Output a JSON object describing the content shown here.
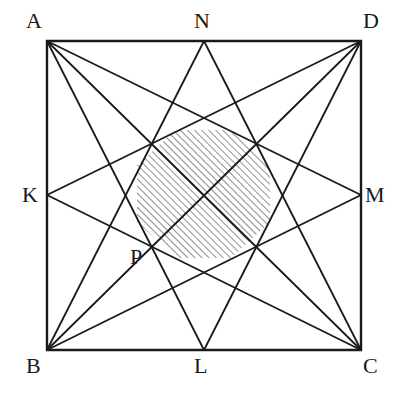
{
  "figure": {
    "background_color": "#ffffff",
    "line_color": "#1a1a1a",
    "hatch_color": "#333333",
    "label_color": "#1a1a1a",
    "canvas": {
      "width": 409,
      "height": 397
    }
  },
  "points": {
    "A": {
      "label": "A",
      "x": 47,
      "y": 41,
      "label_x": 26,
      "label_y": 10,
      "role": "square-corner-top-left"
    },
    "D": {
      "label": "D",
      "x": 361,
      "y": 41,
      "label_x": 363,
      "label_y": 10,
      "role": "square-corner-top-right"
    },
    "B": {
      "label": "B",
      "x": 47,
      "y": 350,
      "label_x": 26,
      "label_y": 355,
      "role": "square-corner-bottom-left"
    },
    "C": {
      "label": "C",
      "x": 361,
      "y": 350,
      "label_x": 363,
      "label_y": 355,
      "role": "square-corner-bottom-right"
    },
    "N": {
      "label": "N",
      "x": 204,
      "y": 41,
      "label_x": 194,
      "label_y": 10,
      "role": "midpoint-of-AD"
    },
    "L": {
      "label": "L",
      "x": 204,
      "y": 350,
      "label_x": 194,
      "label_y": 355,
      "role": "midpoint-of-BC"
    },
    "K": {
      "label": "K",
      "x": 47,
      "y": 195,
      "label_x": 22,
      "label_y": 184,
      "role": "midpoint-of-AB"
    },
    "M": {
      "label": "M",
      "x": 361,
      "y": 195,
      "label_x": 365,
      "label_y": 184,
      "role": "midpoint-of-DC"
    },
    "P": {
      "label": "P",
      "x": 152,
      "y": 247,
      "label_x": 130,
      "label_y": 246,
      "role": "intersection-point"
    }
  },
  "square": {
    "name": "ABCD",
    "corners": [
      "A",
      "D",
      "C",
      "B"
    ],
    "stroke_width": 2.4
  },
  "cevians": [
    {
      "name": "A-L",
      "from": "A",
      "to": "L"
    },
    {
      "name": "A-M",
      "from": "A",
      "to": "M"
    },
    {
      "name": "A-C",
      "from": "A",
      "to": "C"
    },
    {
      "name": "D-L",
      "from": "D",
      "to": "L"
    },
    {
      "name": "D-K",
      "from": "D",
      "to": "K"
    },
    {
      "name": "D-B",
      "from": "D",
      "to": "B"
    },
    {
      "name": "B-N",
      "from": "B",
      "to": "N"
    },
    {
      "name": "B-M",
      "from": "B",
      "to": "M"
    },
    {
      "name": "C-N",
      "from": "C",
      "to": "N"
    },
    {
      "name": "C-K",
      "from": "C",
      "to": "K"
    }
  ],
  "shaded_region": {
    "name": "central-octagon",
    "fill": "hatch-45",
    "hatch_spacing": 5,
    "hatch_angle_deg": 45,
    "vertices": [
      {
        "x": 176,
        "y": 130
      },
      {
        "x": 230,
        "y": 130
      },
      {
        "x": 270,
        "y": 165
      },
      {
        "x": 270,
        "y": 222
      },
      {
        "x": 231,
        "y": 258
      },
      {
        "x": 177,
        "y": 258
      },
      {
        "x": 137,
        "y": 222
      },
      {
        "x": 137,
        "y": 165
      }
    ]
  },
  "labels_order": [
    "A",
    "N",
    "D",
    "K",
    "M",
    "P",
    "B",
    "L",
    "C"
  ]
}
